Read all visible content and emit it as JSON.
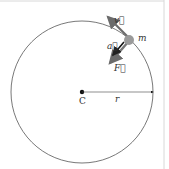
{
  "diagram": {
    "labels": {
      "velocity": "v⃗",
      "acceleration": "a⃗",
      "force": "F⃗",
      "mass": "m",
      "center": "C",
      "radius": "r"
    },
    "colors": {
      "circle": "#555555",
      "vector": "#6b6b6b",
      "mass": "#9a9a9a",
      "frame": "#d8d8d8"
    }
  }
}
